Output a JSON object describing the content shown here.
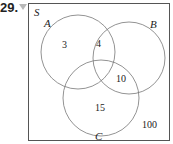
{
  "problem": {
    "number": "29."
  },
  "diagram": {
    "universe_label": "S",
    "sets": [
      {
        "label": "A"
      },
      {
        "label": "B"
      },
      {
        "label": "C"
      }
    ],
    "regions": {
      "A_only": "3",
      "A_and_B": "4",
      "B_and_C": "10",
      "C_only": "15",
      "outside": "100"
    }
  }
}
